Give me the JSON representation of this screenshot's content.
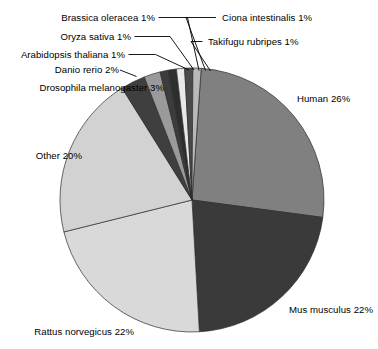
{
  "chart_data": {
    "type": "pie",
    "title": "",
    "subtitle": "",
    "xlabel": "",
    "ylabel": "",
    "legend_position": "none",
    "grid": false,
    "units": "percent",
    "total": 100,
    "start_angle_deg": -86,
    "direction": "clockwise",
    "categories": [
      "Human",
      "Mus musculus",
      "Rattus norvegicus",
      "Other",
      "Drosophila melanogaster",
      "Danio rerio",
      "Arabidopsis thaliana",
      "Oryza sativa",
      "Brassica oleracea",
      "Ciona intestinalis",
      "Takifugu rubripes"
    ],
    "values": [
      26,
      22,
      22,
      20,
      3,
      2,
      1,
      1,
      1,
      1,
      1
    ],
    "labels": [
      "Human 26%",
      "Mus musculus 22%",
      "Rattus norvegicus 22%",
      "Other 20%",
      "Drosophila melanogaster 3%",
      "Danio rerio 2%",
      "Arabidopsis thaliana 1%",
      "Oryza sativa 1%",
      "Brassica oleracea 1%",
      "Ciona intestinalis 1%",
      "Takifugu rubripes 1%"
    ],
    "colors": [
      "#808080",
      "#3a3a3a",
      "#d9d9d9",
      "#d2d2d2",
      "#3f3f3f",
      "#9a9a9a",
      "#3c3c3c",
      "#2e2e2e",
      "#e8e8e8",
      "#4a4a4a",
      "#b9b9b9"
    ],
    "slices": [
      {
        "name": "Human",
        "value": 26,
        "label": "Human 26%",
        "color": "#808080"
      },
      {
        "name": "Mus musculus",
        "value": 22,
        "label": "Mus musculus 22%",
        "color": "#3a3a3a"
      },
      {
        "name": "Rattus norvegicus",
        "value": 22,
        "label": "Rattus norvegicus 22%",
        "color": "#d9d9d9"
      },
      {
        "name": "Other",
        "value": 20,
        "label": "Other 20%",
        "color": "#d2d2d2"
      },
      {
        "name": "Drosophila melanogaster",
        "value": 3,
        "label": "Drosophila melanogaster 3%",
        "color": "#3f3f3f"
      },
      {
        "name": "Danio rerio",
        "value": 2,
        "label": "Danio rerio 2%",
        "color": "#9a9a9a"
      },
      {
        "name": "Arabidopsis thaliana",
        "value": 1,
        "label": "Arabidopsis thaliana 1%",
        "color": "#3c3c3c"
      },
      {
        "name": "Oryza sativa",
        "value": 1,
        "label": "Oryza sativa 1%",
        "color": "#2e2e2e"
      },
      {
        "name": "Brassica oleracea",
        "value": 1,
        "label": "Brassica oleracea 1%",
        "color": "#e8e8e8"
      },
      {
        "name": "Ciona intestinalis",
        "value": 1,
        "label": "Ciona intestinalis 1%",
        "color": "#4a4a4a"
      },
      {
        "name": "Takifugu rubripes",
        "value": 1,
        "label": "Takifugu rubripes 1%",
        "color": "#b9b9b9"
      }
    ],
    "geometry": {
      "center_x": 192,
      "center_y": 200,
      "radius": 132
    }
  },
  "labels": {
    "human": "Human 26%",
    "mus_musculus": "Mus musculus 22%",
    "rattus_norvegicus": "Rattus norvegicus 22%",
    "other": "Other 20%",
    "drosophila_melanogaster": "Drosophila melanogaster 3%",
    "danio_rerio": "Danio rerio 2%",
    "arabidopsis_thaliana": "Arabidopsis thaliana 1%",
    "oryza_sativa": "Oryza sativa 1%",
    "brassica_oleracea": "Brassica oleracea 1%",
    "ciona_intestinalis": "Ciona intestinalis 1%",
    "takifugu_rubripes": "Takifugu rubripes 1%"
  }
}
